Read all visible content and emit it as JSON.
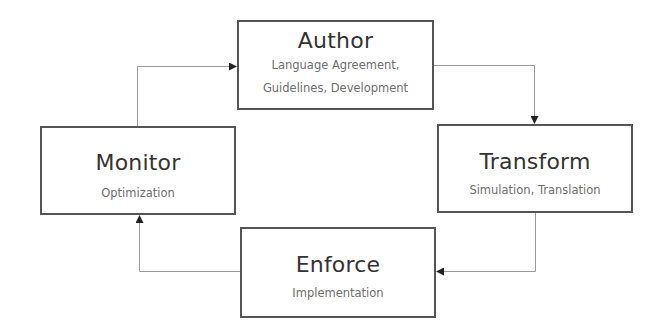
{
  "diagram": {
    "type": "cycle",
    "nodes": [
      {
        "id": "author",
        "title": "Author",
        "subtitle_lines": [
          "Language Agreement,",
          "Guidelines, Development"
        ]
      },
      {
        "id": "transform",
        "title": "Transform",
        "subtitle_lines": [
          "Simulation, Translation"
        ]
      },
      {
        "id": "enforce",
        "title": "Enforce",
        "subtitle_lines": [
          "Implementation"
        ]
      },
      {
        "id": "monitor",
        "title": "Monitor",
        "subtitle_lines": [
          "Optimization"
        ]
      }
    ],
    "edges": [
      {
        "from": "author",
        "to": "transform"
      },
      {
        "from": "transform",
        "to": "enforce"
      },
      {
        "from": "enforce",
        "to": "monitor"
      },
      {
        "from": "monitor",
        "to": "author"
      }
    ],
    "colors": {
      "box_border": "#555555",
      "connector": "#9a9a9a",
      "arrowhead": "#222222",
      "title_text": "#333333",
      "subtitle_text": "#6e6e6e",
      "background": "#ffffff"
    }
  }
}
